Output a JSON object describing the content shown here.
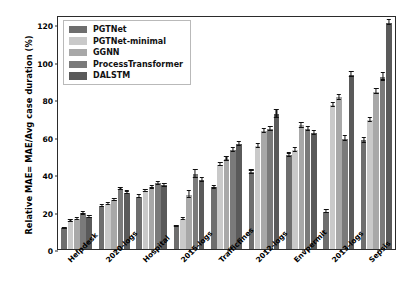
{
  "chart_data": {
    "type": "bar",
    "title": "",
    "xlabel": "",
    "ylabel": "Relative MAE= MAE/Avg case duration (%)",
    "ylim": [
      0,
      125
    ],
    "yticks": [
      0,
      20,
      40,
      60,
      80,
      100,
      120
    ],
    "grid": false,
    "legend_position": "upper left (inside axes)",
    "categories": [
      "Helpdesk",
      "2020-logs",
      "Hospital",
      "2015-logs",
      "Trafficfines",
      "2012-logs",
      "Envpermit",
      "2013-logs",
      "Sepsis"
    ],
    "series": [
      {
        "name": "PGTNet",
        "color": "#6e6e6e",
        "values": [
          11,
          23,
          28,
          12,
          33,
          41,
          50,
          20,
          58
        ],
        "errors": [
          0.4,
          0.5,
          0.6,
          0.4,
          0.7,
          0.9,
          1.0,
          0.6,
          1.2
        ]
      },
      {
        "name": "PGTNet-minimal",
        "color": "#c9c9c9",
        "values": [
          15,
          24,
          31,
          16,
          45,
          55,
          53,
          77,
          69
        ],
        "errors": [
          0.5,
          0.5,
          0.6,
          0.5,
          0.8,
          1.0,
          1.0,
          1.1,
          1.2
        ]
      },
      {
        "name": "GGNN",
        "color": "#a8a8a8",
        "values": [
          16,
          26,
          33,
          29,
          48,
          63,
          66,
          81,
          84
        ],
        "errors": [
          0.5,
          0.6,
          0.7,
          2.0,
          0.9,
          1.1,
          1.2,
          1.2,
          1.4
        ]
      },
      {
        "name": "ProcessTransformer",
        "color": "#7a7a7a",
        "values": [
          19,
          32,
          35,
          40,
          53,
          64,
          64,
          59,
          92
        ],
        "errors": [
          0.6,
          0.7,
          0.7,
          2.2,
          1.0,
          1.2,
          1.1,
          1.2,
          2.0
        ]
      },
      {
        "name": "DALSTM",
        "color": "#5a5a5a",
        "values": [
          17,
          30,
          34,
          37,
          56,
          72,
          62,
          93,
          121
        ],
        "errors": [
          0.6,
          0.7,
          0.8,
          1.0,
          1.1,
          2.0,
          1.1,
          1.3,
          1.4
        ]
      }
    ]
  }
}
